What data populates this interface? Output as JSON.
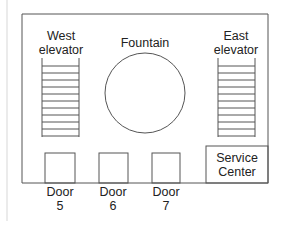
{
  "diagram": {
    "type": "floor-plan",
    "labels": {
      "west_elevator": [
        "West",
        "elevator"
      ],
      "fountain": "Fountain",
      "east_elevator": [
        "East",
        "elevator"
      ],
      "door5": [
        "Door",
        "5"
      ],
      "door6": [
        "Door",
        "6"
      ],
      "door7": [
        "Door",
        "7"
      ],
      "service_center": [
        "Service",
        "Center"
      ]
    },
    "colors": {
      "stroke": "#555555",
      "text": "#222222",
      "background": "#ffffff",
      "margin_line": "#e0e0e0"
    },
    "elevator_rungs": 11
  }
}
